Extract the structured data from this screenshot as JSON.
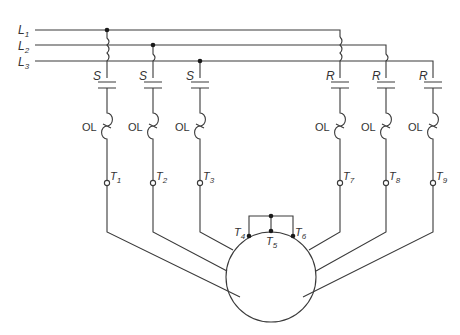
{
  "diagram": {
    "stroke_color": "#3a3a3a",
    "background": "#ffffff",
    "lines": [
      {
        "label": "L",
        "sub": "1"
      },
      {
        "label": "L",
        "sub": "2"
      },
      {
        "label": "L",
        "sub": "3"
      }
    ],
    "contactors": [
      {
        "label": "S"
      },
      {
        "label": "S"
      },
      {
        "label": "S"
      },
      {
        "label": "R"
      },
      {
        "label": "R"
      },
      {
        "label": "R"
      }
    ],
    "overloads": [
      {
        "label": "OL"
      },
      {
        "label": "OL"
      },
      {
        "label": "OL"
      },
      {
        "label": "OL"
      },
      {
        "label": "OL"
      },
      {
        "label": "OL"
      }
    ],
    "terminals": [
      {
        "label": "T",
        "sub": "1"
      },
      {
        "label": "T",
        "sub": "2"
      },
      {
        "label": "T",
        "sub": "3"
      },
      {
        "label": "T",
        "sub": "7"
      },
      {
        "label": "T",
        "sub": "8"
      },
      {
        "label": "T",
        "sub": "9"
      }
    ],
    "motor_terminals": [
      {
        "label": "T",
        "sub": "4"
      },
      {
        "label": "T",
        "sub": "5"
      },
      {
        "label": "T",
        "sub": "6"
      }
    ]
  }
}
